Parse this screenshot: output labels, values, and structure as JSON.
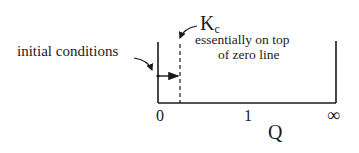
{
  "diagram": {
    "labels": {
      "initial_conditions": "initial conditions",
      "kc_main": "K",
      "kc_sub": "c",
      "note_line1": "essentially on top",
      "note_line2": "of zero line",
      "axis_title": "Q"
    },
    "ticks": [
      "0",
      "1",
      "∞"
    ],
    "colors": {
      "ink": "#1a1a1a",
      "background": "#ffffff"
    }
  }
}
